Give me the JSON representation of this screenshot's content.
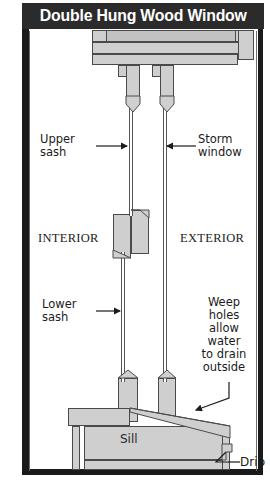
{
  "title": "Double Hung Wood Window",
  "labels": {
    "upper_sash": "Upper\nsash",
    "upper_sash_l1": "Upper",
    "upper_sash_l2": "sash",
    "storm_window_l1": "Storm",
    "storm_window_l2": "window",
    "interior": "INTERIOR",
    "exterior": "EXTERIOR",
    "lower_sash_l1": "Lower",
    "lower_sash_l2": "sash",
    "weep_l1": "Weep",
    "weep_l2": "holes",
    "weep_l3": "allow",
    "weep_l4": "water",
    "weep_l5": "to drain",
    "weep_l6": "outside",
    "sill": "Sill",
    "drip": "Drip"
  },
  "colors": {
    "title_bar_bg": "#2b2b2b",
    "title_text": "#ffffff",
    "wall": "#1a1a1a",
    "wood_fill": "#cfcfcf",
    "wood_stroke": "#4a4a4a",
    "page_bg": "#ffffff",
    "text": "#1c1c1c"
  }
}
